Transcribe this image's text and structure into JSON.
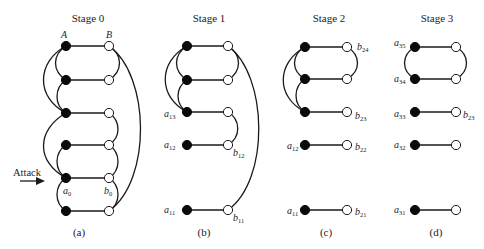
{
  "colors": {
    "line": "#1a1a1a",
    "filled_node": "#0a0a0a",
    "hollow_node": "#ffffff",
    "background": "#ffffff"
  },
  "attack_label": "Attack",
  "panels": [
    {
      "title": "Stage 0",
      "caption": "(a)",
      "column_labels": {
        "left": "A",
        "right": "B"
      },
      "node_labels": {
        "a": "a",
        "a_sub": "0",
        "b": "b",
        "b_sub": "0"
      }
    },
    {
      "title": "Stage 1",
      "caption": "(b)",
      "node_labels": [
        {
          "base": "a",
          "sub": "13"
        },
        {
          "base": "a",
          "sub": "12"
        },
        {
          "base": "b",
          "sub": "12"
        },
        {
          "base": "a",
          "sub": "11"
        },
        {
          "base": "b",
          "sub": "11"
        }
      ]
    },
    {
      "title": "Stage 2",
      "caption": "(c)",
      "node_labels": [
        {
          "base": "b",
          "sub": "24"
        },
        {
          "base": "b",
          "sub": "23"
        },
        {
          "base": "a",
          "sub": "12"
        },
        {
          "base": "b",
          "sub": "22"
        },
        {
          "base": "a",
          "sub": "11"
        },
        {
          "base": "b",
          "sub": "21"
        }
      ]
    },
    {
      "title": "Stage 3",
      "caption": "(d)",
      "node_labels": [
        {
          "base": "a",
          "sub": "35"
        },
        {
          "base": "a",
          "sub": "34"
        },
        {
          "base": "a",
          "sub": "33"
        },
        {
          "base": "b",
          "sub": "23"
        },
        {
          "base": "a",
          "sub": "32"
        },
        {
          "base": "a",
          "sub": "31"
        }
      ]
    }
  ]
}
